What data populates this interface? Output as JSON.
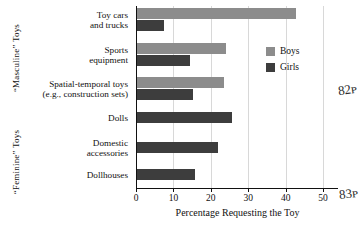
{
  "chart_data": {
    "type": "bar",
    "orientation": "horizontal",
    "title": "",
    "xlabel": "Percentage Requesting the Toy",
    "ylabel": "",
    "xlim": [
      0,
      54
    ],
    "xticks": [
      0,
      10,
      20,
      30,
      40,
      50
    ],
    "grid": true,
    "legend_position": "right",
    "categories": [
      "Toy cars and trucks",
      "Sports equipment",
      "Spatial-temporal toys (e.g., construction sets)",
      "Dolls",
      "Domestic accessories",
      "Dollhouses"
    ],
    "series": [
      {
        "name": "Boys",
        "color": "#8c8c8c",
        "values": [
          42.4,
          23.8,
          23.2,
          null,
          null,
          null
        ]
      },
      {
        "name": "Girls",
        "color": "#3d3d3d",
        "values": [
          7.2,
          14.2,
          15.1,
          25.3,
          21.6,
          15.4
        ]
      }
    ]
  },
  "group_labels": {
    "masculine": "“Masculine” Toys",
    "feminine": "“Feminine” Toys"
  },
  "categories_display": [
    {
      "lines": [
        "Toy cars",
        "and trucks"
      ]
    },
    {
      "lines": [
        "Sports",
        "equipment"
      ]
    },
    {
      "lines": [
        "Spatial-temporal toys",
        "(e.g., construction sets)"
      ]
    },
    {
      "lines": [
        "Dolls"
      ]
    },
    {
      "lines": [
        "Domestic",
        "accessories"
      ]
    },
    {
      "lines": [
        "Dollhouses"
      ]
    }
  ],
  "legend": [
    {
      "label": "Boys",
      "color": "#8c8c8c"
    },
    {
      "label": "Girls",
      "color": "#3d3d3d"
    }
  ],
  "annotations": [
    {
      "text": "82ᴘ",
      "name": "margin-scribble-top"
    },
    {
      "text": "83ᴘ",
      "name": "margin-scribble-bottom"
    }
  ]
}
